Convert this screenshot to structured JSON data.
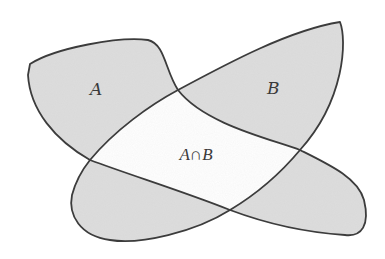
{
  "diagram": {
    "title": "",
    "labels": {
      "set_a": "A",
      "set_b": "B",
      "intersection": "A∩B"
    },
    "colors": {
      "shaded_fill": "#d9d9d9",
      "outline": "#3c3c3c",
      "background": "#ffffff",
      "intersection_fill": "#ffffff"
    },
    "regions": [
      {
        "name": "A only",
        "shaded": true
      },
      {
        "name": "B only",
        "shaded": true
      },
      {
        "name": "A ∩ B",
        "shaded": false
      },
      {
        "name": "lower-left lobe",
        "shaded": true
      },
      {
        "name": "lower-right lobe",
        "shaded": true
      }
    ]
  }
}
